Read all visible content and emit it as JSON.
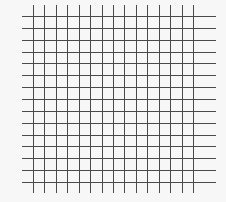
{
  "diagram": {
    "type": "grid",
    "columns": 15,
    "rows": 15,
    "line_color": "#4a4a4a",
    "background_color": "#f7f7f7"
  }
}
